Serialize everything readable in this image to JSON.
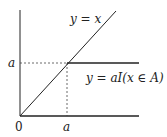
{
  "diagram": {
    "curves": [
      {
        "label": "y = x",
        "type": "identity line"
      },
      {
        "label": "y = aI(x ∈ A)",
        "type": "indicator step"
      }
    ],
    "axis_labels": {
      "origin": "0",
      "x_tick": "a",
      "y_tick": "a"
    },
    "colors": {
      "line": "#222222",
      "background": "#ffffff"
    }
  }
}
